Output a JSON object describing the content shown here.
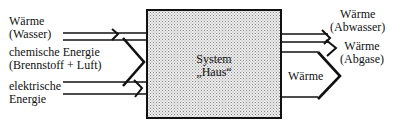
{
  "diagram": {
    "system": {
      "line1": "System",
      "line2": "„Haus“"
    },
    "inputs": {
      "waerme_wasser": {
        "line1": "Wärme",
        "line2": "(Wasser)"
      },
      "chemische": {
        "line1": "chemische Energie",
        "line2": "(Brennstoff + Luft)"
      },
      "elektrische": {
        "line1": "elektrische",
        "line2": "Energie"
      }
    },
    "outputs": {
      "abwasser": {
        "line1": "Wärme",
        "line2": "(Abwasser)"
      },
      "abgase": {
        "line1": "Wärme",
        "line2": "(Abgase)"
      },
      "waerme": {
        "label": "Wärme"
      }
    },
    "colors": {
      "stroke": "#111111",
      "box_fill": "#d9d9d9"
    }
  }
}
